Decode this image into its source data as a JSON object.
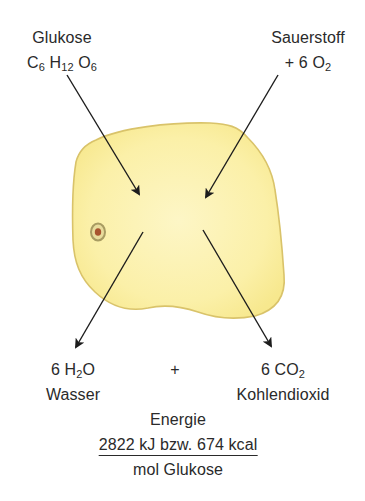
{
  "inputs": {
    "glucose": {
      "name": "Glukose",
      "formula": {
        "c": "C",
        "c_n": "6",
        "h": "H",
        "h_n": "12",
        "o": "O",
        "o_n": "6"
      }
    },
    "oxygen": {
      "name": "Sauerstoff",
      "formula": {
        "prefix": "+ 6 O",
        "o_n": "2"
      }
    }
  },
  "outputs": {
    "water": {
      "formula": {
        "prefix": "6 H",
        "h_n": "2",
        "suffix": "O"
      },
      "name": "Wasser"
    },
    "plus": "+",
    "co2": {
      "formula": {
        "prefix": "6 CO",
        "o_n": "2"
      },
      "name": "Kohlendioxid"
    }
  },
  "energy": {
    "label": "Energie",
    "numerator": "2822 kJ bzw. 674 kcal",
    "denominator": "mol Glukose"
  },
  "colors": {
    "cell_fill": "#fbf0a6",
    "cell_stroke": "#d9c36a",
    "nucleus_outer": "#b9ad6e",
    "nucleus_inner": "#a8542e",
    "arrow": "#1c1c1c",
    "text": "#2a2a2a"
  }
}
